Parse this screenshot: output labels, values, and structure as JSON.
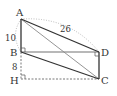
{
  "diagram": {
    "type": "geometry-figure",
    "points": {
      "A": {
        "label": "A",
        "x": 21,
        "y": 19
      },
      "B": {
        "label": "B",
        "x": 21,
        "y": 52
      },
      "H": {
        "label": "H",
        "x": 21,
        "y": 79
      },
      "D": {
        "label": "D",
        "x": 99,
        "y": 52
      },
      "C": {
        "label": "C",
        "x": 99,
        "y": 79
      }
    },
    "measurements": {
      "AB": "10",
      "AD": "26",
      "BH": "8"
    },
    "colors": {
      "solid": "#333333",
      "gray": "#999999",
      "dashed": "#555555",
      "dotted": "#aaaaaa"
    }
  }
}
